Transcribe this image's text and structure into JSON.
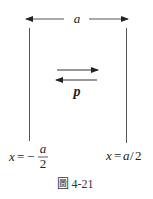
{
  "figure": {
    "dimension_label": "a",
    "momentum_label": "p",
    "left_wall_label": {
      "lhs": "x",
      "eq": "=",
      "sign": "−",
      "numerator": "a",
      "denominator": "2"
    },
    "right_wall_label": {
      "lhs": "x",
      "eq": "=",
      "value_a": "a",
      "slash": "/",
      "value_2": "2"
    },
    "caption": "圖 4-21",
    "colors": {
      "line": "#444444",
      "text": "#222222"
    }
  }
}
